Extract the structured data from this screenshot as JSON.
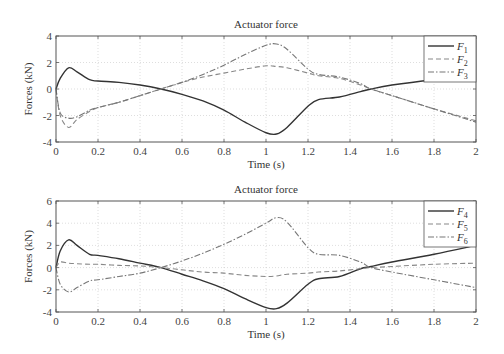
{
  "chart_data": [
    {
      "type": "line",
      "title": "Actuator force",
      "xlabel": "Time (s)",
      "ylabel": "Forces (kN)",
      "xlim": [
        0,
        2
      ],
      "ylim": [
        -4,
        4
      ],
      "xticks": [
        "0",
        "0.2",
        "0.4",
        "0.6",
        "0.8",
        "1",
        "1.2",
        "1.4",
        "1.6",
        "1.8",
        "2"
      ],
      "yticks": [
        "4",
        "2",
        "0",
        "-2",
        "-4"
      ],
      "grid": true,
      "legend_position": "upper right",
      "x": [
        0,
        0.02,
        0.06,
        0.1,
        0.16,
        0.2,
        0.3,
        0.4,
        0.5,
        0.6,
        0.7,
        0.8,
        0.9,
        1.0,
        1.05,
        1.1,
        1.2,
        1.25,
        1.35,
        1.45,
        1.5,
        1.6,
        1.8,
        2.0
      ],
      "series": [
        {
          "name": "F1",
          "label": "F",
          "sub": "1",
          "style": "solid",
          "values": [
            0,
            0.8,
            1.6,
            1.3,
            0.7,
            0.6,
            0.5,
            0.3,
            0.0,
            -0.4,
            -0.9,
            -1.6,
            -2.5,
            -3.3,
            -3.4,
            -2.9,
            -1.3,
            -0.8,
            -0.6,
            -0.2,
            0.0,
            0.3,
            0.7,
            1.0
          ]
        },
        {
          "name": "F2",
          "label": "F",
          "sub": "2",
          "style": "dashed",
          "values": [
            0,
            -2.0,
            -2.9,
            -2.3,
            -1.7,
            -1.4,
            -1.0,
            -0.5,
            0.0,
            0.5,
            0.9,
            1.2,
            1.5,
            1.75,
            1.7,
            1.6,
            1.2,
            1.0,
            0.8,
            0.3,
            0.0,
            -0.5,
            -1.5,
            -2.4
          ]
        },
        {
          "name": "F3",
          "label": "F",
          "sub": "3",
          "style": "dashdot",
          "values": [
            0,
            -1.8,
            -2.2,
            -2.1,
            -1.6,
            -1.4,
            -1.0,
            -0.5,
            0.0,
            0.5,
            1.1,
            1.8,
            2.6,
            3.3,
            3.4,
            3.0,
            1.5,
            1.1,
            0.9,
            0.4,
            0.0,
            -0.5,
            -1.5,
            -2.5
          ]
        }
      ]
    },
    {
      "type": "line",
      "title": "Actuator force",
      "xlabel": "Time (s)",
      "ylabel": "Forces (kN)",
      "xlim": [
        0,
        2
      ],
      "ylim": [
        -4,
        6
      ],
      "xticks": [
        "0",
        "0.2",
        "0.4",
        "0.6",
        "0.8",
        "1",
        "1.2",
        "1.4",
        "1.6",
        "1.8",
        "2"
      ],
      "yticks": [
        "6",
        "4",
        "2",
        "0",
        "-2",
        "-4"
      ],
      "grid": true,
      "legend_position": "upper right",
      "x": [
        0,
        0.02,
        0.06,
        0.1,
        0.16,
        0.2,
        0.3,
        0.4,
        0.5,
        0.6,
        0.7,
        0.8,
        0.9,
        1.0,
        1.05,
        1.1,
        1.2,
        1.25,
        1.35,
        1.45,
        1.5,
        1.6,
        1.8,
        2.0
      ],
      "series": [
        {
          "name": "F4",
          "label": "F",
          "sub": "4",
          "style": "solid",
          "values": [
            0,
            1.5,
            2.5,
            2.0,
            1.2,
            1.1,
            0.8,
            0.4,
            0.0,
            -0.6,
            -1.2,
            -1.9,
            -2.8,
            -3.6,
            -3.7,
            -3.2,
            -1.5,
            -1.0,
            -0.8,
            -0.1,
            0.1,
            0.5,
            1.2,
            2.0
          ]
        },
        {
          "name": "F5",
          "label": "F",
          "sub": "5",
          "style": "dashed",
          "values": [
            0,
            0.5,
            0.4,
            0.35,
            0.3,
            0.3,
            0.2,
            0.15,
            0.0,
            -0.2,
            -0.4,
            -0.5,
            -0.7,
            -0.8,
            -0.75,
            -0.6,
            -0.5,
            -0.4,
            -0.3,
            -0.1,
            0.0,
            0.1,
            0.3,
            0.4
          ]
        },
        {
          "name": "F6",
          "label": "F",
          "sub": "6",
          "style": "dashdot",
          "values": [
            0,
            -1.5,
            -2.2,
            -1.8,
            -1.2,
            -1.1,
            -0.8,
            -0.5,
            0.0,
            0.6,
            1.3,
            2.1,
            3.0,
            4.0,
            4.5,
            4.1,
            1.8,
            1.2,
            1.1,
            0.5,
            0.0,
            -0.4,
            -1.1,
            -1.8
          ]
        }
      ]
    }
  ]
}
